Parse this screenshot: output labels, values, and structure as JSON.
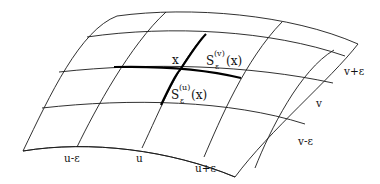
{
  "diagram": {
    "type": "curved-surface-grid",
    "point_label": "x",
    "segment_v": {
      "base": "S",
      "subscript": "ε",
      "superscript": "(v)",
      "arg": "(x)"
    },
    "segment_u": {
      "base": "S",
      "subscript": "ε",
      "superscript": "(u)",
      "arg": "(x)"
    },
    "u_labels": [
      "u-ε",
      "u",
      "u+ε"
    ],
    "v_labels": [
      "v+ε",
      "v",
      "v-ε"
    ]
  }
}
